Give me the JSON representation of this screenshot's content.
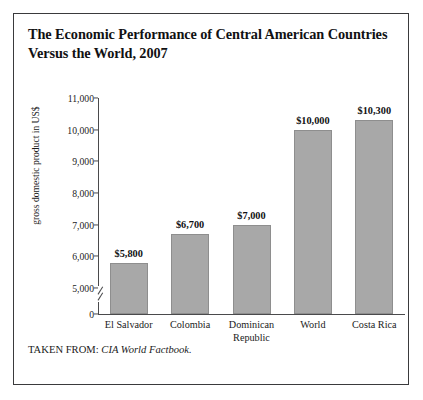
{
  "figure": {
    "title": "The Economic Performance of Central American Countries Versus the World, 2007",
    "source_prefix": "TAKEN FROM:",
    "source_work": "CIA World Factbook."
  },
  "chart_data": {
    "type": "bar",
    "title": "The Economic Performance of Central American Countries Versus the World, 2007",
    "xlabel": "",
    "ylabel": "gross domestic product in US$",
    "categories": [
      "El Salvador",
      "Colombia",
      "Dominican Republic",
      "World",
      "Costa Rica"
    ],
    "values": [
      5800,
      6700,
      7000,
      10000,
      10300
    ],
    "value_labels": [
      "$5,800",
      "$6,700",
      "$7,000",
      "$10,000",
      "$10,300"
    ],
    "ylim": [
      0,
      11000
    ],
    "yticks": [
      0,
      5000,
      6000,
      7000,
      8000,
      9000,
      10000,
      11000
    ],
    "ytick_labels": [
      "0",
      "5,000",
      "6,000",
      "7,000",
      "8,000",
      "9,000",
      "10,000",
      "11,000"
    ],
    "axis_break": true,
    "axis_break_between": [
      0,
      5000
    ],
    "grid": false,
    "legend": false,
    "bar_color": "#a8a8a8",
    "bar_edge_color": "#8e8e8e"
  }
}
